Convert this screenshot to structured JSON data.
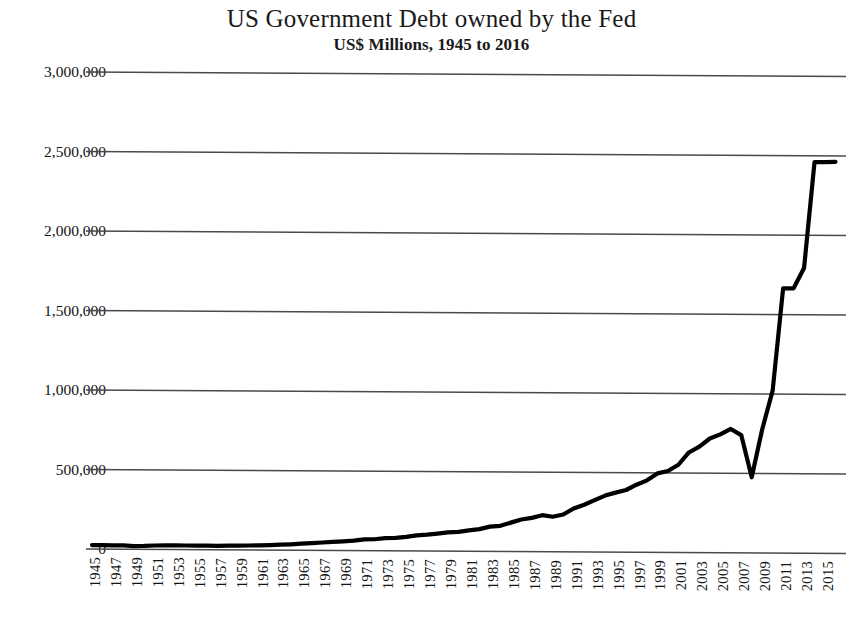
{
  "chart_data": {
    "type": "line",
    "title": "US Government Debt owned by the Fed",
    "subtitle": "US$ Millions, 1945 to 2016",
    "xlabel": "",
    "ylabel": "",
    "grid": true,
    "legend": false,
    "xlim": [
      1945,
      2016
    ],
    "ylim": [
      0,
      3000000
    ],
    "ytick_labels": [
      "3,000,000",
      "2,500,000",
      "2,000,000",
      "1,500,000",
      "1,000,000",
      "500,000",
      "0"
    ],
    "ytick_values": [
      3000000,
      2500000,
      2000000,
      1500000,
      1000000,
      500000,
      0
    ],
    "xtick_labels": [
      "1945",
      "1947",
      "1949",
      "1951",
      "1953",
      "1955",
      "1957",
      "1959",
      "1961",
      "1963",
      "1965",
      "1967",
      "1969",
      "1971",
      "1973",
      "1975",
      "1977",
      "1979",
      "1981",
      "1983",
      "1985",
      "1987",
      "1989",
      "1991",
      "1993",
      "1995",
      "1997",
      "1999",
      "2001",
      "2003",
      "2005",
      "2007",
      "2009",
      "2011",
      "2013",
      "2015"
    ],
    "series": [
      {
        "name": "US Government Debt owned by the Fed",
        "color": "#000000",
        "x": [
          1945,
          1946,
          1947,
          1948,
          1949,
          1950,
          1951,
          1952,
          1953,
          1954,
          1955,
          1956,
          1957,
          1958,
          1959,
          1960,
          1961,
          1962,
          1963,
          1964,
          1965,
          1966,
          1967,
          1968,
          1969,
          1970,
          1971,
          1972,
          1973,
          1974,
          1975,
          1976,
          1977,
          1978,
          1979,
          1980,
          1981,
          1982,
          1983,
          1984,
          1985,
          1986,
          1987,
          1988,
          1989,
          1990,
          1991,
          1992,
          1993,
          1994,
          1995,
          1996,
          1997,
          1998,
          1999,
          2000,
          2001,
          2002,
          2003,
          2004,
          2005,
          2006,
          2007,
          2008,
          2009,
          2010,
          2011,
          2012,
          2013,
          2014,
          2015,
          2016
        ],
        "values": [
          24262,
          23783,
          22559,
          23333,
          19343,
          20778,
          23801,
          24697,
          25916,
          24932,
          24785,
          24915,
          23982,
          26347,
          26648,
          27384,
          28881,
          30820,
          33593,
          36506,
          40885,
          44282,
          49108,
          52937,
          57154,
          62142,
          70218,
          71427,
          78516,
          80649,
          87934,
          97042,
          102510,
          109616,
          117458,
          121328,
          131253,
          139258,
          155527,
          160863,
          181258,
          201062,
          212040,
          229218,
          220088,
          234410,
          272500,
          296397,
          325653,
          355150,
          374114,
          390924,
          424518,
          452522,
          496644,
          511700,
          551700,
          629400,
          666664,
          717819,
          744215,
          778918,
          740600,
          475900,
          776600,
          1021500,
          1664660,
          1666000,
          1794000,
          2461000,
          2461000,
          2463000
        ],
        "approx_marks": {
          "1945_value": 24262,
          "peak_2007": 740600,
          "trough_2008": 475900,
          "plateau_2011_2013": 1660000,
          "final_2016": 2463000
        }
      }
    ]
  },
  "axes": {
    "gridline_color": "#4a4a4a",
    "line_color": "#000000",
    "background": "#ffffff"
  }
}
